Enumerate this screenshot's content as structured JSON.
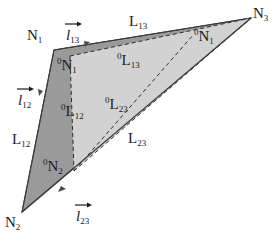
{
  "figure": {
    "type": "geometry-diagram",
    "background_color": "#ffffff",
    "outline_color": "#3a3a3a",
    "colors": {
      "outer_fill": "#9a9a9a",
      "inner_fill": "#d2d2d2",
      "stroke": "#3a3a3a",
      "dashed_stroke": "#2e2e2e",
      "text": "#1a1a1a"
    },
    "shapes": {
      "outer_triangle": {
        "name": "current-configuration-triangle",
        "vertices": [
          {
            "label": "N1",
            "x": 54,
            "y": 50
          },
          {
            "label": "N2",
            "x": 22,
            "y": 212
          },
          {
            "label": "N3",
            "x": 251,
            "y": 18
          }
        ],
        "line_style": "solid",
        "fill": "#9a9a9a"
      },
      "inner_triangle": {
        "name": "reference-configuration-triangle",
        "vertices": [
          {
            "label": "0N1",
            "x": 70,
            "y": 56
          },
          {
            "label": "0N2",
            "x": 74,
            "y": 171
          },
          {
            "label": "N3",
            "x": 251,
            "y": 18
          }
        ],
        "line_style": "dashed",
        "fill": "#d2d2d2"
      },
      "inner_top_node": {
        "name": "0N1-node",
        "x": 194,
        "y": 34
      }
    },
    "vectors": [
      {
        "name": "l12",
        "symbol": "l",
        "subscript": "12",
        "arrow": true,
        "x": 18,
        "y": 92
      },
      {
        "name": "l13",
        "symbol": "l",
        "subscript": "13",
        "arrow": true,
        "x": 66,
        "y": 27
      },
      {
        "name": "l23",
        "symbol": "l",
        "subscript": "23",
        "arrow": true,
        "x": 76,
        "y": 208
      }
    ],
    "node_labels": [
      {
        "name": "N1",
        "superscript": "",
        "base": "N",
        "subscript": "1",
        "x": 27,
        "y": 27
      },
      {
        "name": "N2",
        "superscript": "",
        "base": "N",
        "subscript": "2",
        "x": 5,
        "y": 214
      },
      {
        "name": "N3",
        "superscript": "",
        "base": "N",
        "subscript": "3",
        "x": 253,
        "y": 5
      },
      {
        "name": "0N1-left",
        "superscript": "0",
        "base": "N",
        "subscript": "1",
        "x": 57,
        "y": 57
      },
      {
        "name": "0N1-right",
        "superscript": "0",
        "base": "N",
        "subscript": "1",
        "x": 194,
        "y": 28
      },
      {
        "name": "0N2",
        "superscript": "0",
        "base": "N",
        "subscript": "2",
        "x": 43,
        "y": 158
      }
    ],
    "length_labels": [
      {
        "name": "L12",
        "superscript": "",
        "base": "L",
        "subscript": "12",
        "x": 12,
        "y": 131
      },
      {
        "name": "L13",
        "superscript": "",
        "base": "L",
        "subscript": "13",
        "x": 129,
        "y": 13
      },
      {
        "name": "L23",
        "superscript": "",
        "base": "L",
        "subscript": "23",
        "x": 128,
        "y": 130
      },
      {
        "name": "0L12",
        "superscript": "0",
        "base": "L",
        "subscript": "12",
        "x": 61,
        "y": 103
      },
      {
        "name": "0L13",
        "superscript": "0",
        "base": "L",
        "subscript": "13",
        "x": 117,
        "y": 52
      },
      {
        "name": "0L23",
        "superscript": "0",
        "base": "L",
        "subscript": "23",
        "x": 105,
        "y": 96
      }
    ]
  }
}
